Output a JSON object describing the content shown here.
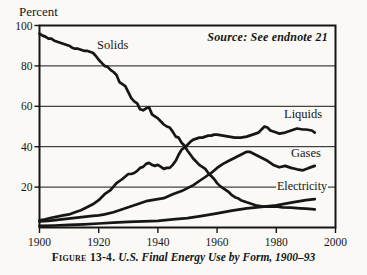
{
  "figure": {
    "percent_label": "Percent",
    "source_note": "Source: See endnote 21",
    "caption": {
      "figure_label": "Figure 13-4.",
      "title": "U.S. Final Energy Use by Form, 1900–93"
    }
  },
  "chart_data": {
    "type": "line",
    "title": "U.S. Final Energy Use by Form, 1900–93",
    "ylabel": "Percent",
    "xlabel": "",
    "xlim": [
      1900,
      2000
    ],
    "ylim": [
      0,
      100
    ],
    "xticks": [
      1900,
      1920,
      1940,
      1960,
      1980,
      2000
    ],
    "yticks": [
      20,
      40,
      60,
      80,
      100
    ],
    "grid": "horizontal",
    "legend_position": "inline-annotations",
    "line_color": "#161616",
    "source": "Source: See endnote 21",
    "annotations": {
      "solids": {
        "text": "Solids"
      },
      "liquids": {
        "text": "Liquids"
      },
      "gases": {
        "text": "Gases"
      },
      "electricity": {
        "text": "Electricity"
      }
    },
    "series": [
      {
        "name": "Solids",
        "points": [
          [
            1900,
            96
          ],
          [
            1901,
            95
          ],
          [
            1902,
            94.5
          ],
          [
            1903,
            93.5
          ],
          [
            1904,
            93.5
          ],
          [
            1905,
            92.5
          ],
          [
            1906,
            92
          ],
          [
            1907,
            91.5
          ],
          [
            1908,
            91
          ],
          [
            1909,
            90.5
          ],
          [
            1910,
            90
          ],
          [
            1911,
            89
          ],
          [
            1912,
            88.5
          ],
          [
            1913,
            88.5
          ],
          [
            1914,
            88
          ],
          [
            1915,
            87.5
          ],
          [
            1916,
            87.5
          ],
          [
            1917,
            87
          ],
          [
            1918,
            86.5
          ],
          [
            1919,
            85
          ],
          [
            1920,
            83
          ],
          [
            1921,
            81.5
          ],
          [
            1922,
            80
          ],
          [
            1923,
            79.5
          ],
          [
            1924,
            78
          ],
          [
            1925,
            77
          ],
          [
            1926,
            75.5
          ],
          [
            1927,
            72
          ],
          [
            1928,
            71
          ],
          [
            1929,
            70
          ],
          [
            1930,
            67
          ],
          [
            1931,
            64
          ],
          [
            1932,
            62.5
          ],
          [
            1933,
            61.5
          ],
          [
            1934,
            58.5
          ],
          [
            1935,
            58
          ],
          [
            1936,
            59
          ],
          [
            1937,
            59.5
          ],
          [
            1938,
            56
          ],
          [
            1939,
            55
          ],
          [
            1940,
            54
          ],
          [
            1941,
            52.5
          ],
          [
            1942,
            51
          ],
          [
            1943,
            50
          ],
          [
            1944,
            49.5
          ],
          [
            1945,
            47.5
          ],
          [
            1946,
            45
          ],
          [
            1947,
            44.5
          ],
          [
            1948,
            42
          ],
          [
            1949,
            40.5
          ],
          [
            1950,
            38
          ],
          [
            1951,
            36
          ],
          [
            1952,
            34
          ],
          [
            1953,
            32.5
          ],
          [
            1954,
            31
          ],
          [
            1955,
            30
          ],
          [
            1956,
            29
          ],
          [
            1957,
            27
          ],
          [
            1958,
            25.5
          ],
          [
            1959,
            24
          ],
          [
            1960,
            22
          ],
          [
            1961,
            20.5
          ],
          [
            1962,
            19.5
          ],
          [
            1963,
            18.5
          ],
          [
            1964,
            17.5
          ],
          [
            1965,
            16
          ],
          [
            1966,
            15
          ],
          [
            1967,
            14.5
          ],
          [
            1968,
            13.5
          ],
          [
            1969,
            13
          ],
          [
            1970,
            12.5
          ],
          [
            1971,
            12
          ],
          [
            1972,
            11.5
          ],
          [
            1973,
            11
          ],
          [
            1975,
            10.5
          ],
          [
            1977,
            10.3
          ],
          [
            1980,
            10.4
          ],
          [
            1982,
            10
          ],
          [
            1985,
            9.8
          ],
          [
            1988,
            9.5
          ],
          [
            1990,
            9.3
          ],
          [
            1993,
            9
          ]
        ]
      },
      {
        "name": "Liquids",
        "points": [
          [
            1900,
            3.5
          ],
          [
            1902,
            4
          ],
          [
            1904,
            4.8
          ],
          [
            1906,
            5.4
          ],
          [
            1908,
            6
          ],
          [
            1910,
            6.5
          ],
          [
            1912,
            7.5
          ],
          [
            1914,
            8.5
          ],
          [
            1916,
            10
          ],
          [
            1918,
            11.5
          ],
          [
            1920,
            13.5
          ],
          [
            1922,
            16.5
          ],
          [
            1924,
            18.5
          ],
          [
            1926,
            22
          ],
          [
            1928,
            24
          ],
          [
            1930,
            26.5
          ],
          [
            1931,
            26.5
          ],
          [
            1932,
            27
          ],
          [
            1933,
            28
          ],
          [
            1934,
            29.5
          ],
          [
            1935,
            30
          ],
          [
            1936,
            31.5
          ],
          [
            1937,
            32
          ],
          [
            1938,
            31
          ],
          [
            1939,
            30.5
          ],
          [
            1940,
            31
          ],
          [
            1941,
            30
          ],
          [
            1942,
            29
          ],
          [
            1943,
            29.5
          ],
          [
            1944,
            29.5
          ],
          [
            1945,
            31
          ],
          [
            1946,
            33
          ],
          [
            1947,
            36
          ],
          [
            1948,
            38.5
          ],
          [
            1949,
            39.5
          ],
          [
            1950,
            41
          ],
          [
            1951,
            42.5
          ],
          [
            1952,
            43.5
          ],
          [
            1953,
            44
          ],
          [
            1954,
            44.5
          ],
          [
            1955,
            44.5
          ],
          [
            1956,
            45
          ],
          [
            1957,
            45.5
          ],
          [
            1958,
            45.5
          ],
          [
            1959,
            46
          ],
          [
            1960,
            46
          ],
          [
            1962,
            45.5
          ],
          [
            1964,
            45
          ],
          [
            1966,
            44.5
          ],
          [
            1968,
            44.5
          ],
          [
            1970,
            45
          ],
          [
            1972,
            46
          ],
          [
            1974,
            47
          ],
          [
            1975,
            48.5
          ],
          [
            1976,
            50
          ],
          [
            1977,
            49.5
          ],
          [
            1978,
            48
          ],
          [
            1980,
            47
          ],
          [
            1981,
            46.5
          ],
          [
            1983,
            47
          ],
          [
            1985,
            48
          ],
          [
            1987,
            49
          ],
          [
            1989,
            48.5
          ],
          [
            1990,
            48.5
          ],
          [
            1992,
            48
          ],
          [
            1993,
            47
          ]
        ]
      },
      {
        "name": "Gases",
        "points": [
          [
            1900,
            3
          ],
          [
            1903,
            3.3
          ],
          [
            1906,
            3.8
          ],
          [
            1909,
            4.3
          ],
          [
            1912,
            4.8
          ],
          [
            1915,
            5.3
          ],
          [
            1918,
            5.8
          ],
          [
            1920,
            6
          ],
          [
            1922,
            6.5
          ],
          [
            1925,
            7.5
          ],
          [
            1928,
            9
          ],
          [
            1930,
            10
          ],
          [
            1933,
            11.5
          ],
          [
            1936,
            13
          ],
          [
            1939,
            13.8
          ],
          [
            1942,
            14.5
          ],
          [
            1945,
            16.5
          ],
          [
            1948,
            18
          ],
          [
            1950,
            19.5
          ],
          [
            1952,
            21
          ],
          [
            1954,
            23
          ],
          [
            1956,
            25
          ],
          [
            1958,
            27
          ],
          [
            1960,
            29.5
          ],
          [
            1962,
            31.5
          ],
          [
            1964,
            33
          ],
          [
            1966,
            34.5
          ],
          [
            1968,
            36
          ],
          [
            1970,
            37.5
          ],
          [
            1971,
            37.5
          ],
          [
            1973,
            36
          ],
          [
            1975,
            34.5
          ],
          [
            1977,
            33
          ],
          [
            1979,
            31
          ],
          [
            1981,
            29.8
          ],
          [
            1983,
            30.5
          ],
          [
            1985,
            29.5
          ],
          [
            1987,
            28.8
          ],
          [
            1989,
            28.3
          ],
          [
            1991,
            29.5
          ],
          [
            1993,
            30.5
          ]
        ]
      },
      {
        "name": "Electricity",
        "points": [
          [
            1900,
            0.8
          ],
          [
            1905,
            1
          ],
          [
            1910,
            1.3
          ],
          [
            1915,
            1.6
          ],
          [
            1920,
            2
          ],
          [
            1925,
            2.4
          ],
          [
            1930,
            2.8
          ],
          [
            1935,
            3
          ],
          [
            1940,
            3.3
          ],
          [
            1945,
            4
          ],
          [
            1950,
            4.6
          ],
          [
            1955,
            5.8
          ],
          [
            1960,
            7
          ],
          [
            1965,
            8.3
          ],
          [
            1970,
            9.5
          ],
          [
            1975,
            10.2
          ],
          [
            1980,
            11
          ],
          [
            1985,
            12.3
          ],
          [
            1990,
            13.5
          ],
          [
            1993,
            14
          ]
        ]
      }
    ]
  }
}
